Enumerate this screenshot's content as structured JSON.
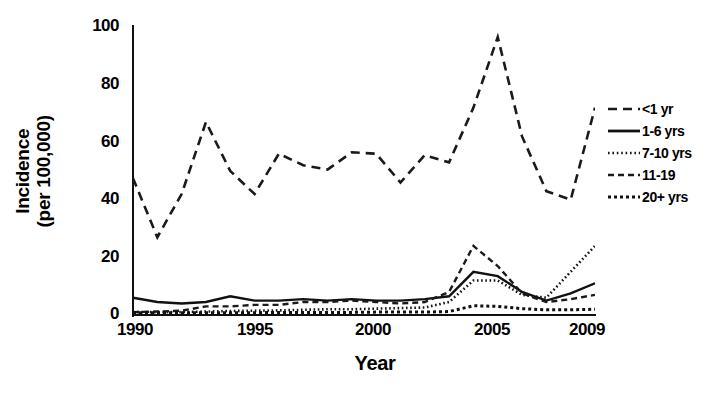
{
  "chart_data": {
    "type": "line",
    "title": "",
    "xlabel": "Year",
    "ylabel": "Incidence (per 100,000)",
    "ylabel_line1": "Incidence",
    "ylabel_line2": "(per 100,000)",
    "xlim": [
      1990,
      2009
    ],
    "ylim": [
      0,
      100
    ],
    "yticks": [
      0,
      20,
      40,
      60,
      80,
      100
    ],
    "xticks": [
      1990,
      1995,
      2000,
      2005,
      2009
    ],
    "xtick_labels": [
      "1990",
      "1995",
      "2000",
      "2005",
      "2009"
    ],
    "ytick_labels": [
      "0",
      "20",
      "40",
      "60",
      "80",
      "100"
    ],
    "grid": false,
    "legend_position": "right",
    "x": [
      1990,
      1991,
      1992,
      1993,
      1994,
      1995,
      1996,
      1997,
      1998,
      1999,
      2000,
      2001,
      2002,
      2003,
      2004,
      2005,
      2006,
      2007,
      2008,
      2009
    ],
    "series": [
      {
        "name": "<1 yr",
        "label": "<1 yr",
        "style": "long-dash",
        "dasharray": "9,6",
        "width": 2.6,
        "color": "#1a1a1a",
        "values": [
          47.5,
          27.0,
          42.0,
          67.0,
          50.0,
          42.0,
          56.0,
          52.0,
          50.5,
          56.5,
          56.0,
          46.0,
          55.5,
          53.0,
          72.0,
          96.5,
          62.0,
          43.0,
          40.0,
          72.0
        ]
      },
      {
        "name": "1-6 yrs",
        "label": "1-6 yrs",
        "style": "solid",
        "dasharray": "none",
        "width": 2.4,
        "color": "#111111",
        "values": [
          6.0,
          4.5,
          4.0,
          4.5,
          6.5,
          5.0,
          5.0,
          5.5,
          5.0,
          5.5,
          5.0,
          5.0,
          5.5,
          6.5,
          15.0,
          13.5,
          8.0,
          5.0,
          7.5,
          11.0
        ]
      },
      {
        "name": "7-10 yrs",
        "label": "7-10 yrs",
        "style": "fine-dot",
        "dasharray": "1.6,2.6",
        "width": 2.6,
        "color": "#161616",
        "values": [
          1.0,
          1.0,
          1.0,
          1.2,
          1.4,
          1.5,
          1.6,
          1.8,
          2.0,
          2.0,
          2.2,
          2.4,
          2.6,
          4.5,
          12.0,
          12.0,
          7.0,
          6.0,
          15.0,
          24.0
        ]
      },
      {
        "name": "11-19",
        "label": "11-19",
        "style": "dash",
        "dasharray": "6,4",
        "width": 2.4,
        "color": "#1a1a1a",
        "values": [
          1.0,
          1.2,
          1.5,
          3.0,
          3.0,
          3.5,
          3.5,
          4.5,
          4.5,
          5.0,
          4.5,
          4.0,
          4.5,
          8.0,
          24.0,
          17.0,
          7.5,
          4.5,
          5.5,
          7.0
        ]
      },
      {
        "name": "20+ yrs",
        "label": "20+ yrs",
        "style": "dot",
        "dasharray": "3,3",
        "width": 3.0,
        "color": "#111111",
        "values": [
          0.8,
          0.8,
          0.8,
          0.8,
          0.8,
          0.8,
          0.9,
          0.9,
          0.9,
          0.9,
          1.0,
          1.0,
          1.0,
          1.2,
          3.2,
          3.0,
          2.2,
          1.8,
          1.8,
          2.0
        ]
      }
    ]
  }
}
